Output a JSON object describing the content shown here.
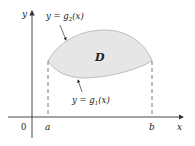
{
  "diagram": {
    "axes": {
      "x_label": "x",
      "y_label": "y",
      "origin_label": "0"
    },
    "ticks": {
      "a_label": "a",
      "b_label": "b"
    },
    "region": {
      "label": "D",
      "fill_color": "#e6e6e6",
      "edge_color": "#a8a8a8"
    },
    "curves": {
      "upper": {
        "prefix": "y = g",
        "sub": "2",
        "suffix": "(x)"
      },
      "lower": {
        "prefix": "y = g",
        "sub": "1",
        "suffix": "(x)"
      }
    },
    "colors": {
      "axis": "#333333",
      "dashed": "#555555",
      "text": "#222222"
    }
  }
}
